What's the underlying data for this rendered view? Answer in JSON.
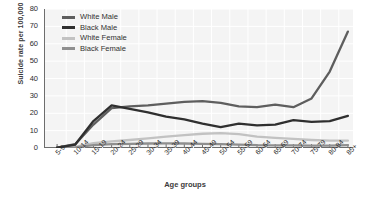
{
  "chart_data": {
    "type": "line",
    "title": "",
    "xlabel": "Age groups",
    "ylabel": "Suicide rate per 100,000",
    "categories": [
      "5-9",
      "10-14",
      "15-19",
      "20-24",
      "25-29",
      "30-34",
      "35-39",
      "40-44",
      "45-49",
      "50-54",
      "55-59",
      "60-64",
      "65-69",
      "70-74",
      "75-79",
      "80-84",
      "85+"
    ],
    "ylim": [
      0,
      80
    ],
    "yticks": [
      0,
      10,
      20,
      30,
      40,
      50,
      60,
      70,
      80
    ],
    "grid": true,
    "legend_position": "top-left",
    "series": [
      {
        "name": "White Male",
        "color": "#5e5e5e",
        "values": [
          0.2,
          2.2,
          13.5,
          23.0,
          24.0,
          24.5,
          25.5,
          26.5,
          27.0,
          26.0,
          24.0,
          23.5,
          25.0,
          23.5,
          28.5,
          44.0,
          67.0
        ]
      },
      {
        "name": "Black Male",
        "color": "#2f2f2f",
        "values": [
          0.2,
          2.0,
          15.5,
          24.5,
          22.5,
          20.5,
          18.0,
          16.5,
          14.0,
          12.0,
          14.0,
          13.0,
          13.5,
          16.0,
          15.0,
          15.5,
          18.5
        ]
      },
      {
        "name": "White Female",
        "color": "#c2c2c2",
        "values": [
          0.1,
          0.6,
          2.8,
          3.8,
          4.6,
          5.6,
          6.6,
          7.4,
          8.2,
          8.6,
          8.0,
          6.6,
          5.8,
          5.2,
          4.6,
          4.2,
          4.2
        ]
      },
      {
        "name": "Black Female",
        "color": "#8f8f8f",
        "values": [
          0.1,
          0.4,
          1.6,
          2.2,
          2.4,
          2.6,
          2.7,
          2.6,
          2.4,
          2.2,
          2.0,
          1.6,
          1.5,
          1.5,
          1.4,
          1.4,
          1.6
        ]
      }
    ]
  }
}
